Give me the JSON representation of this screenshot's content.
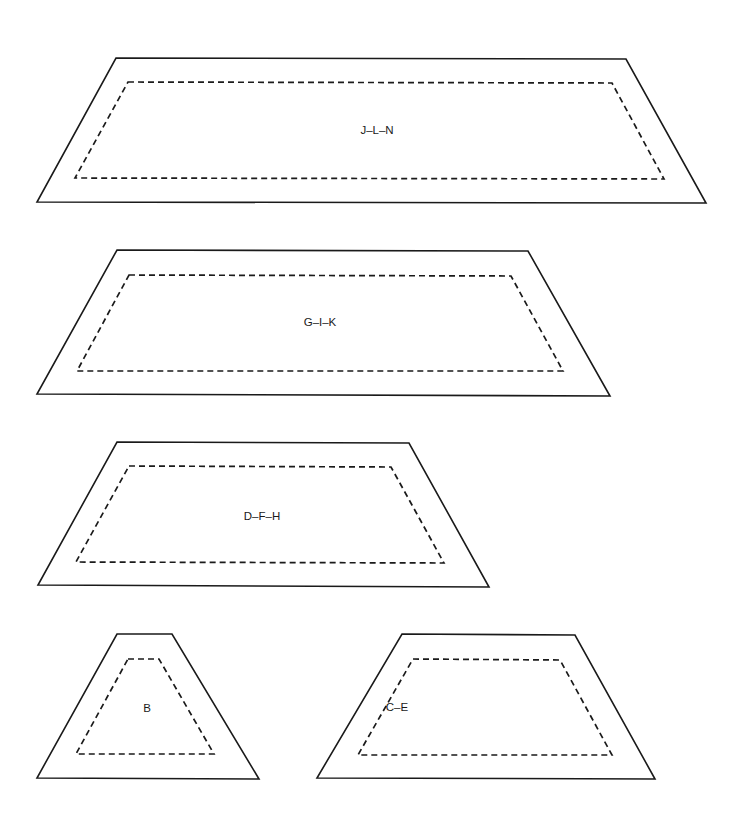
{
  "diagram": {
    "pieces": [
      {
        "id": "jln",
        "label": "J–L–N",
        "label_pos": [
          377,
          131
        ],
        "outer": "116,58 626,59 706,203 37,202",
        "inner": "128,82 612,83 664,179 75,178"
      },
      {
        "id": "gik",
        "label": "G–I–K",
        "label_pos": [
          320,
          323
        ],
        "outer": "117,250 528,251 610,396 37,394",
        "inner": "129,275 511,276 563,371 77,371"
      },
      {
        "id": "dfh",
        "label": "D–F–H",
        "label_pos": [
          262,
          517
        ],
        "outer": "117,442 409,443 489,587 38,585",
        "inner": "129,466 391,467 444,563 76,562"
      },
      {
        "id": "b",
        "label": "B",
        "label_pos": [
          147,
          709
        ],
        "outer": "117,634 172,634 259,779 37,778",
        "inner": "128,659 159,659 214,754 76,754"
      },
      {
        "id": "ce",
        "label": "C–E",
        "label_pos": [
          397,
          708
        ],
        "outer": "402,634 575,635 655,779 317,778",
        "inner": "413,659 560,660 612,755 358,755"
      }
    ]
  }
}
